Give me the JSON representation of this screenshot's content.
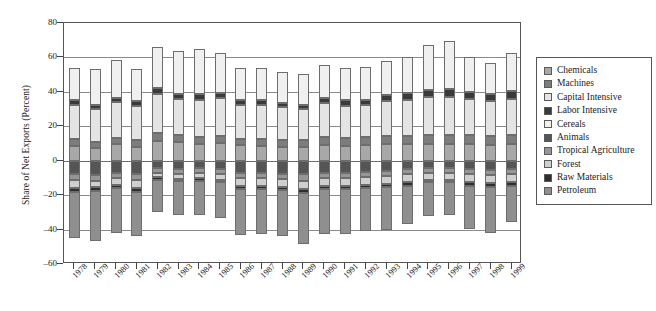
{
  "chart_data": {
    "type": "bar",
    "stacked": true,
    "title": "",
    "xlabel": "",
    "ylabel": "Share of Net Exports (Percent)",
    "ylim": [
      -60,
      80
    ],
    "yticks": [
      80,
      60,
      40,
      20,
      0,
      -20,
      -40,
      -60
    ],
    "grid": true,
    "legend_position": "right",
    "categories": [
      "1978",
      "1979",
      "1980",
      "1981",
      "1982",
      "1983",
      "1984",
      "1985",
      "1986",
      "1987",
      "1988",
      "1989",
      "1990",
      "1991",
      "1992",
      "1993",
      "1994",
      "1995",
      "1996",
      "1997",
      "1998",
      "1999"
    ],
    "series": [
      {
        "name": "Chemicals",
        "color": "#a8a8a8",
        "values": [
          8.5,
          7.5,
          9.5,
          8.0,
          11.5,
          11.0,
          9.5,
          10.5,
          9.0,
          8.5,
          8.0,
          8.0,
          9.0,
          8.5,
          9.0,
          9.5,
          9.5,
          9.5,
          9.5,
          9.5,
          9.0,
          9.5
        ]
      },
      {
        "name": "Machines",
        "color": "#7d7d7d",
        "values": [
          4.0,
          3.5,
          3.5,
          4.0,
          4.5,
          4.0,
          4.0,
          4.0,
          3.5,
          4.0,
          4.0,
          4.0,
          4.5,
          4.5,
          4.5,
          5.0,
          5.0,
          5.5,
          5.5,
          5.5,
          5.5,
          5.5
        ]
      },
      {
        "name": "Capital Intensive",
        "color": "#e4e4e4",
        "values": [
          20.0,
          19.0,
          21.0,
          20.0,
          23.0,
          21.0,
          22.0,
          22.0,
          20.0,
          20.0,
          19.0,
          18.0,
          20.0,
          19.0,
          19.0,
          20.0,
          21.0,
          22.0,
          22.0,
          21.0,
          20.0,
          21.0
        ]
      },
      {
        "name": "Labor Intensive",
        "color": "#3a3a3a",
        "values": [
          2.5,
          2.5,
          2.5,
          2.5,
          3.0,
          3.0,
          3.0,
          3.0,
          2.5,
          2.5,
          2.5,
          2.5,
          3.0,
          3.0,
          3.0,
          3.5,
          4.0,
          4.0,
          4.5,
          4.0,
          4.0,
          4.5
        ]
      },
      {
        "name": "Cereals",
        "color": "#f0f0f0",
        "values": [
          19.0,
          20.5,
          22.0,
          19.0,
          24.0,
          25.0,
          26.5,
          23.0,
          19.0,
          19.0,
          18.0,
          18.0,
          19.0,
          19.0,
          19.0,
          20.0,
          21.0,
          26.0,
          28.0,
          20.0,
          18.0,
          22.0
        ]
      },
      {
        "name": "Animals",
        "color": "#555555",
        "values": [
          -8.0,
          -8.5,
          -7.0,
          -8.0,
          -4.5,
          -5.0,
          -4.5,
          -5.0,
          -7.0,
          -7.0,
          -7.5,
          -8.0,
          -7.0,
          -7.0,
          -6.5,
          -6.0,
          -5.0,
          -4.0,
          -4.0,
          -5.0,
          -5.5,
          -5.0
        ]
      },
      {
        "name": "Tropical Agriculture",
        "color": "#969696",
        "values": [
          -3.0,
          -3.0,
          -3.0,
          -3.0,
          -2.5,
          -2.5,
          -2.5,
          -2.5,
          -3.0,
          -3.0,
          -3.0,
          -3.5,
          -3.0,
          -3.0,
          -3.0,
          -3.0,
          -3.0,
          -3.0,
          -3.0,
          -3.0,
          -3.0,
          -3.0
        ]
      },
      {
        "name": "Forest",
        "color": "#cfcfcf",
        "values": [
          -5.0,
          -4.0,
          -4.0,
          -5.0,
          -2.5,
          -3.0,
          -3.0,
          -3.5,
          -4.5,
          -4.5,
          -4.5,
          -5.0,
          -4.5,
          -4.5,
          -4.5,
          -4.5,
          -4.5,
          -4.0,
          -4.0,
          -4.5,
          -4.5,
          -4.5
        ]
      },
      {
        "name": "Raw Materials",
        "color": "#2e2e2e",
        "values": [
          -2.0,
          -2.0,
          -2.0,
          -2.0,
          -1.5,
          -1.5,
          -1.5,
          -1.5,
          -2.0,
          -2.0,
          -2.0,
          -2.0,
          -2.0,
          -2.0,
          -2.0,
          -2.0,
          -2.0,
          -1.5,
          -1.5,
          -2.0,
          -2.0,
          -2.0
        ]
      },
      {
        "name": "Petroleum",
        "color": "#8f8f8f",
        "values": [
          -27.0,
          -29.0,
          -26.0,
          -26.0,
          -19.0,
          -19.5,
          -20.0,
          -21.0,
          -26.5,
          -26.0,
          -27.0,
          -30.0,
          -26.0,
          -26.0,
          -25.0,
          -24.5,
          -22.0,
          -19.5,
          -19.0,
          -25.0,
          -27.0,
          -21.0
        ]
      }
    ]
  }
}
